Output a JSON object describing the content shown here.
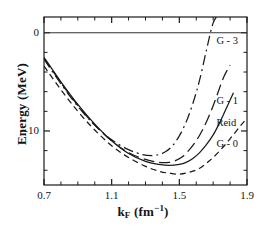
{
  "chart_data": {
    "type": "line",
    "title": "",
    "xlabel": "k_F (fm^-1)",
    "xlabel_base": "k",
    "xlabel_sub": "F",
    "xlabel_unit_open": " (fm",
    "xlabel_unit_sup": "−1",
    "xlabel_unit_close": ")",
    "ylabel": "Energy (MeV)",
    "xlim": [
      0.7,
      1.9
    ],
    "ylim": [
      -15.5,
      1.6
    ],
    "grid": false,
    "legend_position": "inline-right",
    "xticks": [
      0.7,
      1.1,
      1.5,
      1.9
    ],
    "xtick_labels": [
      "0.7",
      "1.1",
      "1.5",
      "1.9"
    ],
    "xminor_step": 0.1,
    "yticks": [
      0,
      -10
    ],
    "ytick_labels": [
      "0",
      "-10"
    ],
    "yminor_step": 2,
    "zero_line": 0,
    "series": [
      {
        "name": "G - 3",
        "label": "G - 3",
        "style": "dash-dot",
        "color": "#1a1a1a",
        "x": [
          0.7,
          0.8,
          0.9,
          1.0,
          1.1,
          1.2,
          1.28,
          1.34,
          1.38,
          1.42,
          1.46,
          1.5,
          1.54,
          1.58,
          1.62,
          1.66,
          1.7,
          1.74
        ],
        "y": [
          -2.7,
          -5.2,
          -7.5,
          -9.4,
          -10.9,
          -11.9,
          -12.4,
          -12.5,
          -12.4,
          -12.1,
          -11.5,
          -10.5,
          -9.1,
          -7.2,
          -4.8,
          -1.8,
          1.0,
          2.0
        ]
      },
      {
        "name": "G - 1",
        "label": "G - 1",
        "style": "long-dash",
        "color": "#1a1a1a",
        "x": [
          0.7,
          0.8,
          0.9,
          1.0,
          1.1,
          1.2,
          1.3,
          1.38,
          1.44,
          1.48,
          1.52,
          1.56,
          1.6,
          1.64,
          1.68,
          1.72,
          1.76,
          1.8
        ],
        "y": [
          -2.6,
          -5.1,
          -7.4,
          -9.4,
          -11.0,
          -12.2,
          -12.9,
          -13.2,
          -13.2,
          -13.0,
          -12.6,
          -11.9,
          -11.0,
          -9.8,
          -8.3,
          -6.5,
          -4.6,
          -3.3
        ]
      },
      {
        "name": "Reid",
        "label": "Reid",
        "style": "solid",
        "color": "#1a1a1a",
        "x": [
          0.7,
          0.8,
          0.9,
          1.0,
          1.1,
          1.2,
          1.3,
          1.38,
          1.44,
          1.5,
          1.54,
          1.58,
          1.62,
          1.66,
          1.7,
          1.74,
          1.78,
          1.82
        ],
        "y": [
          -2.5,
          -5.0,
          -7.3,
          -9.3,
          -11.0,
          -12.3,
          -13.1,
          -13.4,
          -13.5,
          -13.4,
          -13.2,
          -12.8,
          -12.2,
          -11.4,
          -10.4,
          -9.1,
          -7.6,
          -6.1
        ]
      },
      {
        "name": "G - 0",
        "label": "G - 0",
        "style": "dashed",
        "color": "#1a1a1a",
        "x": [
          0.7,
          0.8,
          0.9,
          1.0,
          1.1,
          1.2,
          1.3,
          1.38,
          1.44,
          1.5,
          1.56,
          1.62,
          1.68,
          1.74,
          1.8,
          1.86,
          1.9
        ],
        "y": [
          -3.4,
          -5.8,
          -8.0,
          -9.9,
          -11.5,
          -12.7,
          -13.6,
          -14.1,
          -14.3,
          -14.4,
          -14.2,
          -13.8,
          -13.0,
          -12.0,
          -10.8,
          -9.5,
          -8.7
        ]
      }
    ],
    "annotations": [
      {
        "text": "G - 3",
        "x": 1.79,
        "y": -0.9
      },
      {
        "text": "G - 1",
        "x": 1.79,
        "y": -7.1
      },
      {
        "text": "Reid",
        "x": 1.79,
        "y": -9.3
      },
      {
        "text": "G - 0",
        "x": 1.79,
        "y": -11.4
      }
    ]
  },
  "axes": {
    "x_title": "k",
    "x_title_sub": "F",
    "x_units": "(fm",
    "x_units_sup": "−1",
    "x_units_end": ")",
    "y_title": "Energy (MeV)"
  },
  "colors": {
    "frame": "#1a1a1a",
    "curve": "#1a1a1a",
    "background": "#ffffff",
    "zero_line": "#333333"
  }
}
